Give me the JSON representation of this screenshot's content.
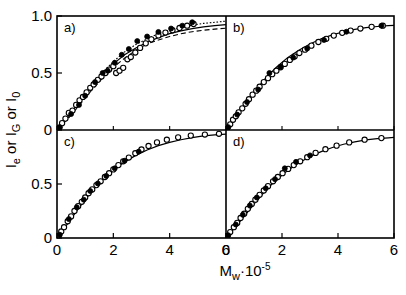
{
  "figure": {
    "ylabel": "Iₑ or I_G or I₀",
    "ylabel_parts": {
      "main1": "I",
      "sub1": "e",
      "mid": " or ",
      "main2": "I",
      "sub2": "G",
      "mid2": " or ",
      "main3": "I",
      "sub3": "0"
    },
    "xlabel_main": "M",
    "xlabel_sub": "w",
    "xlabel_mid": "·10",
    "xlabel_sup": "-5",
    "panel_labels": [
      "a)",
      "b)",
      "c)",
      "d)"
    ],
    "ytick_labels_top": [
      "1.0",
      "0.5",
      "0"
    ],
    "ytick_labels_bottom": [
      "0.5",
      "0"
    ],
    "xtick_labels_left": [
      "0",
      "2",
      "4",
      "6"
    ],
    "xtick_labels_right": [
      "0",
      "2",
      "4",
      "6"
    ],
    "axis_color": "#000000",
    "frame_color": "#000000"
  },
  "chart_data": {
    "type": "scatter",
    "title": "",
    "xlabel": "Mw·10-5",
    "ylabel": "Ie or IG or I0",
    "xlim": [
      0,
      6
    ],
    "ylim": [
      0,
      1.0
    ],
    "grid": false,
    "legend": "none",
    "panel_layout": "2x2",
    "panels": [
      {
        "label": "a)",
        "position": "top-left",
        "xlim": [
          0,
          6
        ],
        "ylim": [
          0,
          1.0
        ],
        "xticks": [
          0,
          2,
          4,
          6
        ],
        "yticks": [
          0,
          0.5,
          1.0
        ],
        "curves": [
          {
            "name": "solid",
            "style": "solid",
            "x": [
              0.0,
              0.2,
              0.4,
              0.6,
              0.8,
              1.0,
              1.3,
              1.6,
              2.0,
              2.4,
              2.8,
              3.2,
              3.6,
              4.0,
              4.4,
              4.8,
              5.2,
              5.6,
              6.0
            ],
            "y": [
              0.01,
              0.05,
              0.11,
              0.18,
              0.25,
              0.32,
              0.41,
              0.49,
              0.58,
              0.66,
              0.72,
              0.77,
              0.81,
              0.845,
              0.87,
              0.89,
              0.905,
              0.915,
              0.925
            ]
          },
          {
            "name": "dotted",
            "style": "dotted",
            "x": [
              0.0,
              0.4,
              0.8,
              1.2,
              1.6,
              2.0,
              2.4,
              2.8,
              3.2,
              3.6,
              4.0,
              4.4,
              4.8,
              5.2,
              5.6,
              6.0
            ],
            "y": [
              0.01,
              0.12,
              0.26,
              0.38,
              0.5,
              0.6,
              0.685,
              0.75,
              0.8,
              0.845,
              0.875,
              0.9,
              0.92,
              0.935,
              0.945,
              0.955
            ]
          },
          {
            "name": "dashed",
            "style": "dashed",
            "x": [
              0.0,
              0.4,
              0.8,
              1.2,
              1.6,
              2.0,
              2.4,
              2.8,
              3.2,
              3.6,
              4.0,
              4.4,
              4.8,
              5.2,
              5.6,
              6.0
            ],
            "y": [
              0.01,
              0.1,
              0.22,
              0.34,
              0.45,
              0.55,
              0.63,
              0.7,
              0.755,
              0.79,
              0.82,
              0.845,
              0.862,
              0.875,
              0.885,
              0.893
            ]
          }
        ],
        "series": [
          {
            "name": "open-circles",
            "marker": "open-circle",
            "x": [
              0.08,
              0.18,
              0.3,
              0.42,
              0.55,
              0.68,
              0.8,
              0.92,
              1.05,
              1.18,
              1.3,
              1.45,
              1.58,
              1.72,
              1.85,
              2.0,
              2.1,
              2.22,
              2.35,
              2.5,
              2.62,
              2.78,
              2.95,
              3.15,
              3.35,
              3.6,
              3.85,
              4.1,
              4.35,
              4.62,
              4.85
            ],
            "y": [
              0.02,
              0.06,
              0.1,
              0.15,
              0.17,
              0.22,
              0.26,
              0.29,
              0.33,
              0.37,
              0.4,
              0.44,
              0.47,
              0.5,
              0.53,
              0.56,
              0.5,
              0.52,
              0.545,
              0.62,
              0.64,
              0.68,
              0.72,
              0.76,
              0.795,
              0.83,
              0.855,
              0.875,
              0.895,
              0.915,
              0.93
            ]
          },
          {
            "name": "filled-circles",
            "marker": "filled-circle",
            "x": [
              0.1,
              0.5,
              0.78,
              1.0,
              1.35,
              1.62,
              1.8,
              2.05,
              2.3,
              2.55,
              2.85,
              3.2,
              3.6,
              4.05,
              4.45,
              4.8
            ],
            "y": [
              0.025,
              0.14,
              0.22,
              0.3,
              0.42,
              0.5,
              0.52,
              0.59,
              0.66,
              0.71,
              0.78,
              0.82,
              0.86,
              0.89,
              0.915,
              0.945
            ]
          }
        ]
      },
      {
        "label": "b)",
        "position": "top-right",
        "xlim": [
          0,
          6
        ],
        "ylim": [
          0,
          1.0
        ],
        "xticks": [
          0,
          2,
          4,
          6
        ],
        "yticks": [
          0,
          0.5,
          1.0
        ],
        "curves": [
          {
            "name": "solid",
            "style": "solid",
            "x": [
              0.0,
              0.2,
              0.5,
              0.8,
              1.1,
              1.4,
              1.8,
              2.2,
              2.6,
              3.0,
              3.4,
              3.8,
              4.2,
              4.6,
              5.0,
              5.4,
              5.8,
              6.0
            ],
            "y": [
              0.01,
              0.06,
              0.16,
              0.26,
              0.36,
              0.45,
              0.55,
              0.635,
              0.7,
              0.755,
              0.8,
              0.835,
              0.862,
              0.882,
              0.898,
              0.908,
              0.915,
              0.918
            ]
          }
        ],
        "series": [
          {
            "name": "open-circles",
            "marker": "open-circle",
            "x": [
              0.05,
              0.15,
              0.25,
              0.35,
              0.45,
              0.58,
              0.7,
              0.82,
              0.95,
              1.08,
              1.2,
              1.35,
              1.5,
              1.65,
              1.8,
              1.95,
              2.1,
              2.28,
              2.45,
              2.62,
              2.82,
              3.05,
              3.3,
              3.58,
              3.85,
              4.15,
              4.45,
              4.8,
              5.2,
              5.6
            ],
            "y": [
              0.02,
              0.05,
              0.09,
              0.12,
              0.155,
              0.19,
              0.23,
              0.27,
              0.31,
              0.345,
              0.38,
              0.42,
              0.455,
              0.49,
              0.52,
              0.55,
              0.58,
              0.615,
              0.645,
              0.675,
              0.705,
              0.74,
              0.772,
              0.8,
              0.828,
              0.852,
              0.872,
              0.89,
              0.905,
              0.915
            ]
          },
          {
            "name": "filled-circles",
            "marker": "filled-circle",
            "x": [
              0.08,
              0.4,
              0.75,
              1.15,
              1.55,
              1.95,
              2.4,
              2.9,
              3.5,
              4.3,
              5.55
            ],
            "y": [
              0.025,
              0.135,
              0.245,
              0.355,
              0.5,
              0.555,
              0.635,
              0.715,
              0.79,
              0.862,
              0.915
            ]
          }
        ]
      },
      {
        "label": "c)",
        "position": "bottom-left",
        "xlim": [
          0,
          6
        ],
        "ylim": [
          0,
          1.0
        ],
        "xticks": [
          0,
          2,
          4,
          6
        ],
        "yticks": [
          0,
          0.5
        ],
        "curves": [
          {
            "name": "solid",
            "style": "solid",
            "x": [
              0.0,
              0.2,
              0.4,
              0.7,
              1.0,
              1.3,
              1.6,
              2.0,
              2.4,
              2.8,
              3.2,
              3.6,
              4.0,
              4.4,
              4.8,
              5.2,
              5.6,
              6.0
            ],
            "y": [
              0.01,
              0.07,
              0.14,
              0.25,
              0.355,
              0.45,
              0.535,
              0.63,
              0.705,
              0.765,
              0.815,
              0.855,
              0.885,
              0.91,
              0.93,
              0.945,
              0.955,
              0.962
            ]
          }
        ],
        "series": [
          {
            "name": "open-circles",
            "marker": "open-circle",
            "x": [
              0.05,
              0.15,
              0.25,
              0.38,
              0.5,
              0.62,
              0.75,
              0.88,
              1.0,
              1.12,
              1.25,
              1.4,
              1.55,
              1.7,
              1.85,
              2.0,
              2.18,
              2.35,
              2.55,
              2.78,
              3.0,
              3.25,
              3.55,
              3.9,
              4.3,
              4.75,
              5.25,
              5.75
            ],
            "y": [
              0.02,
              0.06,
              0.1,
              0.155,
              0.2,
              0.25,
              0.295,
              0.335,
              0.375,
              0.415,
              0.45,
              0.49,
              0.525,
              0.565,
              0.6,
              0.635,
              0.675,
              0.71,
              0.745,
              0.785,
              0.82,
              0.852,
              0.885,
              0.91,
              0.932,
              0.948,
              0.958,
              0.965
            ]
          },
          {
            "name": "filled-circles",
            "marker": "filled-circle",
            "x": [
              0.1,
              0.42,
              0.7,
              0.95,
              1.18,
              1.45,
              1.75,
              2.05,
              2.4,
              2.9
            ],
            "y": [
              0.03,
              0.175,
              0.285,
              0.355,
              0.435,
              0.505,
              0.575,
              0.645,
              0.715,
              0.8
            ]
          }
        ]
      },
      {
        "label": "d)",
        "position": "bottom-right",
        "xlim": [
          0,
          6
        ],
        "ylim": [
          0,
          1.0
        ],
        "xticks": [
          0,
          2,
          4,
          6
        ],
        "yticks": [
          0,
          0.5
        ],
        "curves": [
          {
            "name": "solid",
            "style": "solid",
            "x": [
              0.0,
              0.2,
              0.5,
              0.8,
              1.1,
              1.4,
              1.8,
              2.2,
              2.6,
              3.0,
              3.4,
              3.8,
              4.2,
              4.6,
              5.0,
              5.4,
              5.8,
              6.0
            ],
            "y": [
              0.01,
              0.06,
              0.155,
              0.25,
              0.345,
              0.435,
              0.54,
              0.625,
              0.695,
              0.755,
              0.8,
              0.838,
              0.868,
              0.89,
              0.908,
              0.92,
              0.928,
              0.932
            ]
          }
        ],
        "series": [
          {
            "name": "open-circles",
            "marker": "open-circle",
            "x": [
              0.05,
              0.15,
              0.28,
              0.4,
              0.52,
              0.65,
              0.78,
              0.92,
              1.05,
              1.2,
              1.35,
              1.5,
              1.68,
              1.85,
              2.02,
              2.22,
              2.42,
              2.65,
              2.9,
              3.2,
              3.55,
              3.95,
              4.4,
              4.95,
              5.55
            ],
            "y": [
              0.02,
              0.055,
              0.1,
              0.14,
              0.185,
              0.225,
              0.27,
              0.315,
              0.355,
              0.4,
              0.44,
              0.48,
              0.525,
              0.565,
              0.6,
              0.64,
              0.675,
              0.71,
              0.748,
              0.788,
              0.822,
              0.855,
              0.885,
              0.91,
              0.925
            ]
          },
          {
            "name": "filled-circles",
            "marker": "filled-circle",
            "x": [
              0.08,
              0.35,
              0.6,
              0.85,
              1.1,
              1.42,
              1.75,
              2.1,
              2.5,
              3.0
            ],
            "y": [
              0.025,
              0.125,
              0.215,
              0.3,
              0.375,
              0.46,
              0.545,
              0.645,
              0.705,
              0.765
            ]
          }
        ]
      }
    ]
  }
}
